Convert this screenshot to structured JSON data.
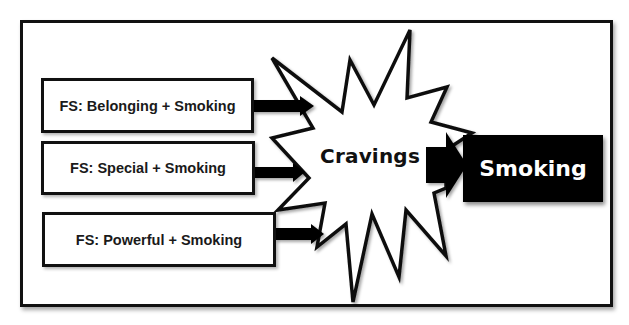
{
  "diagram": {
    "inputs": [
      {
        "label": "FS: Belonging + Smoking"
      },
      {
        "label": "FS: Special + Smoking"
      },
      {
        "label": "FS: Powerful + Smoking"
      }
    ],
    "center": {
      "label": "Cravings",
      "shape": "starburst"
    },
    "output": {
      "label": "Smoking"
    },
    "colors": {
      "stroke": "#111111",
      "fill": "#ffffff",
      "output_fill": "#000000",
      "output_text": "#ffffff"
    }
  }
}
